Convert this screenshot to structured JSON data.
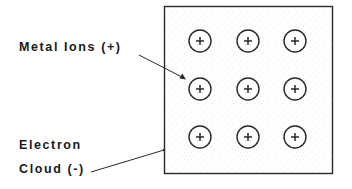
{
  "diagram": {
    "labels": {
      "metal_ions": "Metal Ions (+)",
      "electron_line1": "Electron",
      "electron_line2": "Cloud (-)"
    },
    "lattice": {
      "rows": 3,
      "cols": 3,
      "ion_symbol": "+",
      "ion_count": 9
    },
    "colors": {
      "stroke": "#2a2a2a",
      "cloud_stipple": "#bdbdbd",
      "background": "#ffffff"
    }
  }
}
